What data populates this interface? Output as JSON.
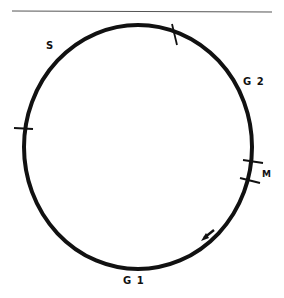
{
  "diagram": {
    "phases": [
      {
        "id": "S",
        "label": "S"
      },
      {
        "id": "G2",
        "label": "G 2"
      },
      {
        "id": "M",
        "label": "M"
      },
      {
        "id": "G1",
        "label": "G 1"
      }
    ],
    "direction": "counterclockwise arrow near G1",
    "colors": {
      "stroke": "#111111",
      "background": "#ffffff",
      "rule": "#555555"
    }
  }
}
